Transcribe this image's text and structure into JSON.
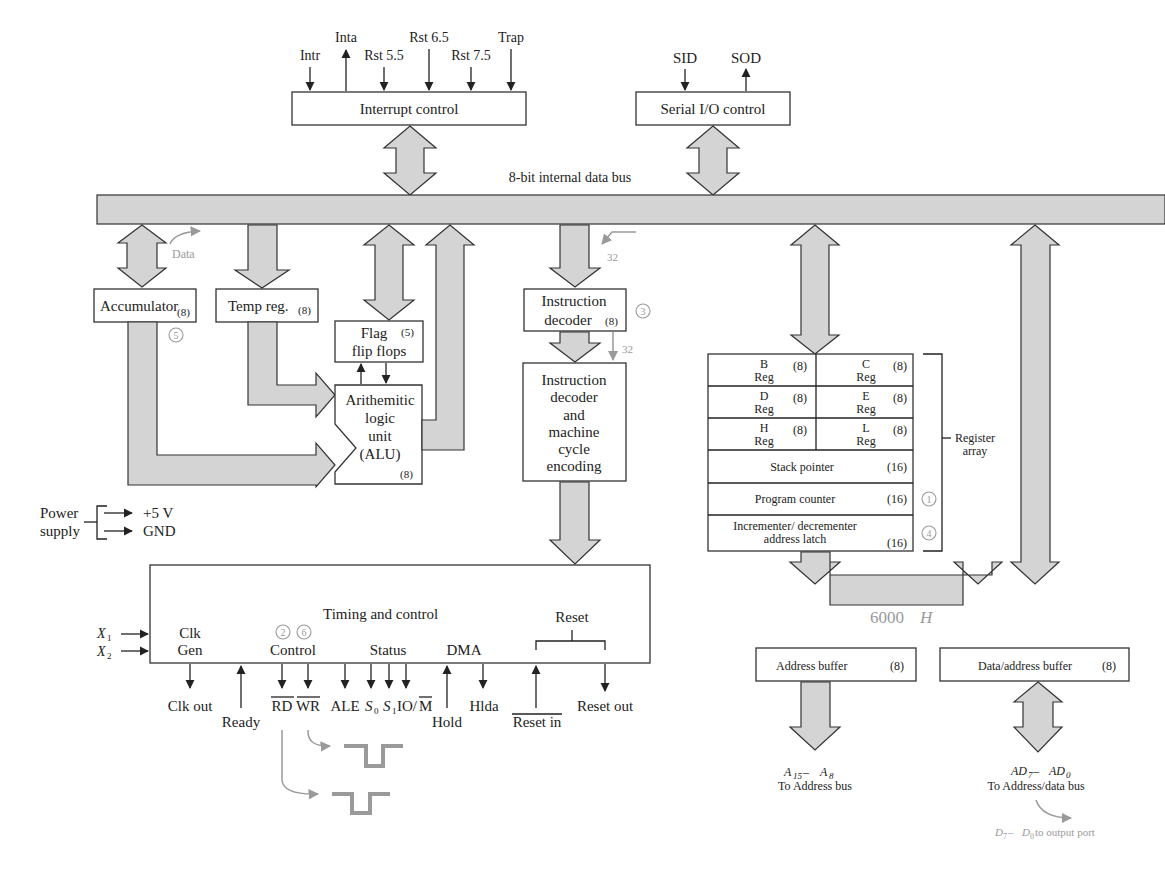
{
  "diagram": {
    "colors": {
      "bus_fill": "#d4d4d4",
      "annotation_gray": "#9a9a9a",
      "line": "#222222"
    },
    "interrupt": {
      "box_label": "Interrupt control",
      "signals": [
        {
          "label": "Intr",
          "direction": "in"
        },
        {
          "label": "Inta",
          "direction": "out"
        },
        {
          "label": "Rst 5.5",
          "direction": "in"
        },
        {
          "label": "Rst 6.5",
          "direction": "in"
        },
        {
          "label": "Rst 7.5",
          "direction": "in"
        },
        {
          "label": "Trap",
          "direction": "in"
        }
      ]
    },
    "serial": {
      "box_label": "Serial I/O control",
      "signals": [
        {
          "label": "SID",
          "direction": "in"
        },
        {
          "label": "SOD",
          "direction": "out"
        }
      ]
    },
    "bus_label": "8-bit internal data bus",
    "accumulator": {
      "label": "Accumulator",
      "size": "(8)",
      "step": "5"
    },
    "data_annotation": "Data",
    "temp_reg": {
      "label": "Temp reg.",
      "size": "(8)"
    },
    "flags": {
      "line1": "Flag",
      "line2": "flip flops",
      "size": "(5)"
    },
    "alu": {
      "lines": [
        "Arithemitic",
        "logic",
        "unit",
        "(ALU)"
      ],
      "size": "(8)"
    },
    "instr_reg": {
      "line1": "Instruction",
      "line2": "decoder",
      "size": "(8)",
      "step": "3",
      "in_annotation": "32",
      "out_annotation": "32"
    },
    "instr_decoder": {
      "lines": [
        "Instruction",
        "decoder",
        "and",
        "machine",
        "cycle",
        "encoding"
      ]
    },
    "register_array": {
      "label_line1": "Register",
      "label_line2": "array",
      "pairs": [
        {
          "left": {
            "name": "B",
            "sub": "Reg",
            "size": "(8)"
          },
          "right": {
            "name": "C",
            "sub": "Reg",
            "size": "(8)"
          }
        },
        {
          "left": {
            "name": "D",
            "sub": "Reg",
            "size": "(8)"
          },
          "right": {
            "name": "E",
            "sub": "Reg",
            "size": "(8)"
          }
        },
        {
          "left": {
            "name": "H",
            "sub": "Reg",
            "size": "(8)"
          },
          "right": {
            "name": "L",
            "sub": "Reg",
            "size": "(8)"
          }
        }
      ],
      "stack_pointer": {
        "label": "Stack pointer",
        "size": "(16)"
      },
      "program_counter": {
        "label": "Program counter",
        "size": "(16)",
        "step": "1"
      },
      "inc_dec": {
        "line1": "Incrementer/ decrementer",
        "line2": "address latch",
        "size": "(16)",
        "step": "4"
      }
    },
    "power": {
      "label_line1": "Power",
      "label_line2": "supply",
      "outputs": [
        "+5 V",
        "GND"
      ]
    },
    "timing": {
      "label": "Timing and control",
      "clk_gen_line1": "Clk",
      "clk_gen_line2": "Gen",
      "x1": "X",
      "x1_sub": "1",
      "x2": "X",
      "x2_sub": "2",
      "control_group": "Control",
      "control_steps": [
        "2",
        "6"
      ],
      "status_group": "Status",
      "dma_group": "DMA",
      "reset_group": "Reset",
      "signals": {
        "clk_out": "Clk out",
        "ready": "Ready",
        "rd": "RD",
        "wr": "WR",
        "ale": "ALE",
        "s0": "S",
        "s0_sub": "0",
        "s1": "S",
        "s1_sub": "1",
        "io_m_prefix": "IO/",
        "io_m_bar": "M",
        "hold": "Hold",
        "hlda": "Hlda",
        "reset_in": "Reset in",
        "reset_out": "Reset out"
      }
    },
    "address_value": "6000",
    "address_value_suffix": "H",
    "address_buffer": {
      "label": "Address buffer",
      "size": "(8)"
    },
    "data_address_buffer": {
      "label": "Data/address buffer",
      "size": "(8)"
    },
    "address_out": {
      "line1_a": "A",
      "line1_a_sub": "15",
      "line1_sep": " – ",
      "line1_b": "A",
      "line1_b_sub": "8",
      "line2": "To Address bus"
    },
    "data_out": {
      "line1_a": "AD",
      "line1_a_sub": "7",
      "line1_sep": " – ",
      "line1_b": "AD",
      "line1_b_sub": "0",
      "line2": "To Address/data bus"
    },
    "output_port_note": {
      "a": "D",
      "a_sub": "7",
      "sep": " – ",
      "b": "D",
      "b_sub": "0",
      "rest": " to output port"
    }
  }
}
